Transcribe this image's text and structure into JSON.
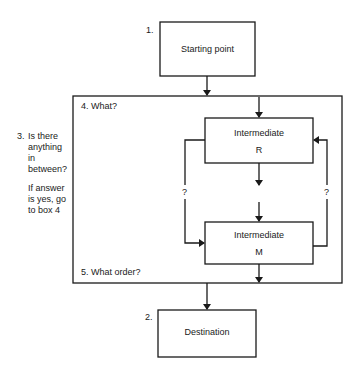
{
  "boxes": {
    "start": {
      "number": "1.",
      "label": "Starting point"
    },
    "destination": {
      "number": "2.",
      "label": "Destination"
    },
    "intermediate_r": {
      "label": "Intermediate",
      "letter": "R"
    },
    "intermediate_m": {
      "label": "Intermediate",
      "letter": "M"
    }
  },
  "outer_box": {
    "top_label": "4. What?",
    "bottom_label": "5. What order?"
  },
  "side_note": {
    "number": "3.",
    "question_lines": [
      "Is there",
      "anything",
      "in",
      "between?"
    ],
    "instruction_lines": [
      "If answer",
      "is yes, go",
      "to box 4"
    ]
  },
  "loops": {
    "left_label": "?",
    "right_label": "?"
  },
  "colors": {
    "line": "#1a1a1a",
    "background": "#ffffff"
  }
}
